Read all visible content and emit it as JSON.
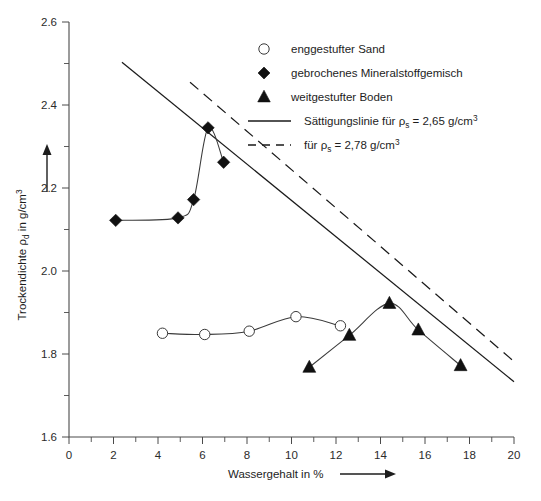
{
  "chart_data": {
    "type": "scatter",
    "title": "",
    "xlabel": "Wassergehalt in %",
    "ylabel": "Trockendichte ρd in g/cm3",
    "xlim": [
      0,
      20
    ],
    "ylim": [
      1.6,
      2.6
    ],
    "xticks": [
      "0",
      "2",
      "4",
      "6",
      "8",
      "10",
      "12",
      "14",
      "16",
      "18",
      "20"
    ],
    "yticks": [
      "1.6",
      "1.8",
      "2.0",
      "2.2",
      "2.4",
      "2.6"
    ],
    "xtick_step": 2,
    "ytick_step": 0.2,
    "minor_ticks": true,
    "grid": false,
    "legend_position": "top-right",
    "series": [
      {
        "name": "enggestufter Sand",
        "marker": "open-circle",
        "line": "solid-thin",
        "x": [
          4.2,
          6.1,
          8.1,
          10.2,
          12.2
        ],
        "y": [
          1.85,
          1.847,
          1.855,
          1.89,
          1.868
        ]
      },
      {
        "name": "gebrochenes Mineralstoffgemisch",
        "marker": "filled-diamond",
        "line": "solid-thin",
        "x": [
          2.1,
          4.9,
          5.6,
          6.25,
          6.95
        ],
        "y": [
          2.122,
          2.128,
          2.172,
          2.345,
          2.262
        ]
      },
      {
        "name": "weitgestufter Boden",
        "marker": "filled-triangle",
        "line": "solid-thin",
        "x": [
          10.8,
          12.6,
          14.4,
          15.7,
          17.6
        ],
        "y": [
          1.768,
          1.845,
          1.922,
          1.858,
          1.772
        ]
      }
    ],
    "reference_lines": [
      {
        "name": "Sättigungslinie für ρs = 2,65 g/cm3",
        "style": "solid",
        "x": [
          2.38,
          20.0
        ],
        "y": [
          2.503,
          1.733
        ]
      },
      {
        "name": "für ρs = 2,78 g/cm3",
        "style": "dashed",
        "x": [
          5.44,
          20.0
        ],
        "y": [
          2.455,
          1.782
        ]
      }
    ]
  },
  "legend": {
    "entries": [
      {
        "label": "enggestufter Sand",
        "symbol": "open-circle"
      },
      {
        "label": "gebrochenes Mineralstoffgemisch",
        "symbol": "filled-diamond"
      },
      {
        "label": "weitgestufter Boden",
        "symbol": "filled-triangle"
      }
    ],
    "line_entries": [
      {
        "prefix": "Sättigungslinie für ",
        "rho": "ρ",
        "rho_sub": "s",
        "value": " = 2,65 g/cm",
        "exp": "3",
        "symbol": "solid-line"
      },
      {
        "prefix": "für ",
        "rho": "ρ",
        "rho_sub": "s",
        "value": " = 2,78 g/cm",
        "exp": "3",
        "symbol": "dashed-line"
      }
    ]
  },
  "axes": {
    "x_title": "Wassergehalt in %",
    "y_title_pre": "Trockendichte ",
    "y_title_rho": "ρ",
    "y_title_sub": "d",
    "y_title_post": " in g/cm",
    "y_title_exp": "3",
    "x_labels": [
      "0",
      "2",
      "4",
      "6",
      "8",
      "10",
      "12",
      "14",
      "16",
      "18",
      "20"
    ],
    "y_labels": [
      "1.6",
      "1.8",
      "2.0",
      "2.2",
      "2.4",
      "2.6"
    ]
  },
  "colors": {
    "axis": "#4a4a4a",
    "marker": "#111111",
    "line": "#3a3a3a",
    "reference": "#1a1a1a",
    "background": "#ffffff"
  }
}
